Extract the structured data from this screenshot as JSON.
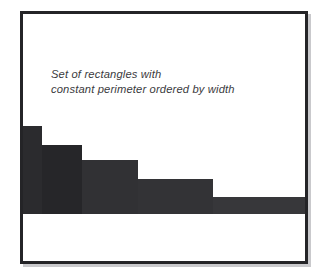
{
  "figure": {
    "caption_lines": [
      "Set of rectangles with",
      "constant perimeter ordered by width"
    ],
    "frame_color": "#242427",
    "background_color": "#ffffff"
  },
  "chart_data": {
    "type": "bar",
    "title": "Set of rectangles with constant perimeter ordered by width",
    "xlabel": "",
    "ylabel": "",
    "grid": false,
    "legend": null,
    "annotations": [
      "Set of rectangles with",
      "constant perimeter ordered by width"
    ],
    "categories": [
      "1",
      "2",
      "3",
      "4",
      "5"
    ],
    "widths": [
      19,
      40,
      56,
      75,
      92
    ],
    "values": [
      88,
      69,
      54,
      35,
      17
    ],
    "bar_colors": [
      "#2b2b2e",
      "#262629",
      "#313134",
      "#333336",
      "#37373a"
    ],
    "xlim": [
      0,
      282
    ],
    "ylim": [
      0,
      200
    ],
    "note": "Bars share a constant perimeter; width increases left to right while height decreases."
  }
}
